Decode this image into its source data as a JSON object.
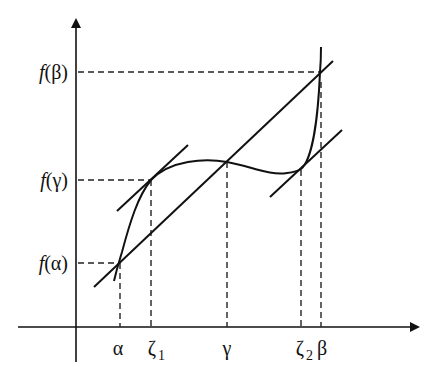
{
  "diagram": {
    "type": "mean-value-theorem-illustration",
    "axes": {
      "origin": [
        76,
        327
      ],
      "x_axis": {
        "from": [
          18,
          327
        ],
        "to": [
          418,
          327
        ],
        "arrow": true
      },
      "y_axis": {
        "from": [
          76,
          362
        ],
        "to": [
          76,
          20
        ],
        "arrow": true
      }
    },
    "x_labels": [
      {
        "id": "alpha",
        "text": "α",
        "sub": "",
        "x": 118
      },
      {
        "id": "zeta1",
        "text": "ζ",
        "sub": "1",
        "x": 152
      },
      {
        "id": "gamma",
        "text": "γ",
        "sub": "",
        "x": 227
      },
      {
        "id": "zeta2",
        "text": "ζ",
        "sub": "2",
        "x": 300
      },
      {
        "id": "beta",
        "text": "β",
        "sub": "",
        "x": 322
      }
    ],
    "y_labels": [
      {
        "id": "f-beta",
        "f": "f",
        "arg": "(β)",
        "y": 72
      },
      {
        "id": "f-gamma",
        "f": "f",
        "arg": "(γ)",
        "y": 180
      },
      {
        "id": "f-alpha",
        "f": "f",
        "arg": "(α)",
        "y": 263
      }
    ],
    "points": {
      "alpha": [
        120,
        263
      ],
      "zeta1": [
        151,
        180
      ],
      "gamma": [
        227,
        162
      ],
      "zeta2": [
        301,
        170
      ],
      "beta": [
        320,
        72
      ]
    },
    "lines": {
      "secant": {
        "from": [
          94,
          287
        ],
        "to": [
          333,
          61
        ]
      },
      "tangent_zeta1": {
        "from": [
          117,
          211
        ],
        "to": [
          188,
          145
        ]
      },
      "tangent_zeta2": {
        "from": [
          270,
          197
        ],
        "to": [
          342,
          130
        ]
      }
    },
    "curve_label": "f(x)"
  }
}
